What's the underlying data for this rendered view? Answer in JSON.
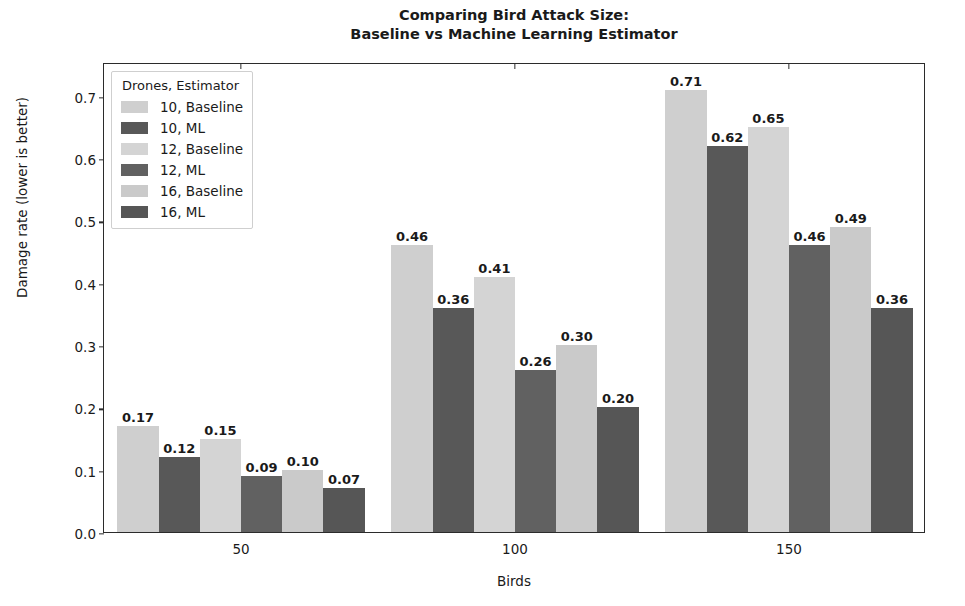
{
  "chart_data": {
    "type": "bar",
    "title": "Comparing Bird Attack Size:\nBaseline vs Machine Learning Estimator",
    "title_line1": "Comparing Bird Attack Size:",
    "title_line2": "Baseline vs Machine Learning Estimator",
    "xlabel": "Birds",
    "ylabel": "Damage rate (lower is better)",
    "categories": [
      "50",
      "100",
      "150"
    ],
    "xtick_labels": [
      "50",
      "100",
      "150"
    ],
    "ytick_labels": [
      "0.0",
      "0.1",
      "0.2",
      "0.3",
      "0.4",
      "0.5",
      "0.6",
      "0.7"
    ],
    "ytick_values": [
      0.0,
      0.1,
      0.2,
      0.3,
      0.4,
      0.5,
      0.6,
      0.7
    ],
    "ylim": [
      0.0,
      0.7543
    ],
    "grid": false,
    "legend_position": "upper left",
    "legend_title": "Drones, Estimator",
    "series": [
      {
        "name": "10, Baseline",
        "color": "#cfcfcf",
        "values": [
          0.17,
          0.46,
          0.71
        ],
        "labels": [
          "0.17",
          "0.46",
          "0.71"
        ]
      },
      {
        "name": "10, ML",
        "color": "#585858",
        "values": [
          0.12,
          0.36,
          0.62
        ],
        "labels": [
          "0.12",
          "0.36",
          "0.62"
        ]
      },
      {
        "name": "12, Baseline",
        "color": "#d4d4d4",
        "values": [
          0.15,
          0.41,
          0.65
        ],
        "labels": [
          "0.15",
          "0.41",
          "0.65"
        ]
      },
      {
        "name": "12, ML",
        "color": "#616161",
        "values": [
          0.09,
          0.26,
          0.46
        ],
        "labels": [
          "0.09",
          "0.26",
          "0.46"
        ]
      },
      {
        "name": "16, Baseline",
        "color": "#cacaca",
        "values": [
          0.1,
          0.3,
          0.49
        ],
        "labels": [
          "0.10",
          "0.30",
          "0.49"
        ]
      },
      {
        "name": "16, ML",
        "color": "#565656",
        "values": [
          0.07,
          0.2,
          0.36
        ],
        "labels": [
          "0.07",
          "0.20",
          "0.36"
        ]
      }
    ]
  },
  "legend": {
    "title": "Drones, Estimator",
    "items": [
      {
        "label": "10, Baseline",
        "color": "#cfcfcf"
      },
      {
        "label": "10, ML",
        "color": "#585858"
      },
      {
        "label": "12, Baseline",
        "color": "#d4d4d4"
      },
      {
        "label": "12, ML",
        "color": "#616161"
      },
      {
        "label": "16, Baseline",
        "color": "#cacaca"
      },
      {
        "label": "16, ML",
        "color": "#565656"
      }
    ]
  },
  "colors": {
    "axis": "#2b2b2b",
    "text": "#1a1a1a",
    "background": "#ffffff",
    "legend_border": "#cfcfcf"
  }
}
